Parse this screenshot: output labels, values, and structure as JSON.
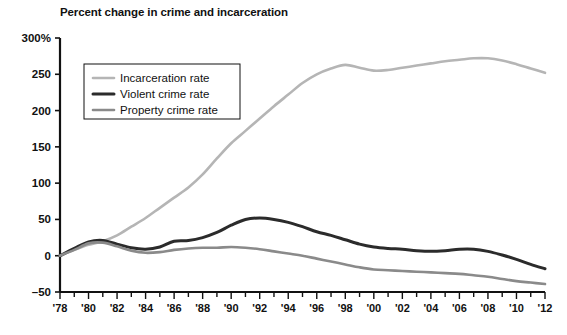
{
  "chart_data": {
    "type": "line",
    "title": "Percent change in crime and incarceration",
    "xlabel": "",
    "ylabel": "",
    "ylim": [
      -50,
      300
    ],
    "xlim": [
      1978,
      2012
    ],
    "grid": false,
    "legend_position": "upper-left",
    "ytick_labels": [
      "300%",
      "250",
      "200",
      "150",
      "100",
      "50",
      "0",
      "-50"
    ],
    "ytick_values": [
      300,
      250,
      200,
      150,
      100,
      50,
      0,
      -50
    ],
    "xtick_labels": [
      "'78",
      "'80",
      "'82",
      "'84",
      "'86",
      "'88",
      "'90",
      "'92",
      "'94",
      "'96",
      "'98",
      "'00",
      "'02",
      "'04",
      "'06",
      "'08",
      "'10",
      "'12"
    ],
    "xtick_values": [
      1978,
      1980,
      1982,
      1984,
      1986,
      1988,
      1990,
      1992,
      1994,
      1996,
      1998,
      2000,
      2002,
      2004,
      2006,
      2008,
      2010,
      2012
    ],
    "x": [
      1978,
      1979,
      1980,
      1981,
      1982,
      1983,
      1984,
      1985,
      1986,
      1987,
      1988,
      1989,
      1990,
      1991,
      1992,
      1993,
      1994,
      1995,
      1996,
      1997,
      1998,
      1999,
      2000,
      2001,
      2002,
      2003,
      2004,
      2005,
      2006,
      2007,
      2008,
      2009,
      2010,
      2011,
      2012
    ],
    "series": [
      {
        "name": "Incarceration rate",
        "color": "#b5b5b5",
        "width": 2.6,
        "values": [
          0,
          8,
          15,
          20,
          28,
          40,
          52,
          66,
          80,
          94,
          112,
          134,
          155,
          172,
          189,
          206,
          222,
          238,
          250,
          258,
          263,
          259,
          255,
          256,
          259,
          262,
          265,
          268,
          270,
          272,
          272,
          269,
          264,
          258,
          252
        ]
      },
      {
        "name": "Violent crime rate",
        "color": "#2b2b2b",
        "width": 3.0,
        "values": [
          0,
          10,
          19,
          21,
          16,
          11,
          9,
          12,
          20,
          21,
          25,
          32,
          42,
          50,
          52,
          50,
          46,
          40,
          33,
          28,
          22,
          16,
          12,
          10,
          9,
          7,
          6,
          7,
          9,
          9,
          6,
          1,
          -5,
          -12,
          -18
        ]
      },
      {
        "name": "Property crime rate",
        "color": "#8a8a8a",
        "width": 2.6,
        "values": [
          0,
          8,
          17,
          18,
          13,
          7,
          4,
          5,
          8,
          10,
          11,
          11,
          12,
          11,
          9,
          6,
          3,
          0,
          -4,
          -8,
          -12,
          -16,
          -19,
          -20,
          -21,
          -22,
          -23,
          -24,
          -25,
          -27,
          -29,
          -32,
          -35,
          -37,
          -39
        ]
      }
    ]
  },
  "legend": {
    "items": [
      {
        "label": "Incarceration rate"
      },
      {
        "label": "Violent crime rate"
      },
      {
        "label": "Property crime rate"
      }
    ]
  }
}
